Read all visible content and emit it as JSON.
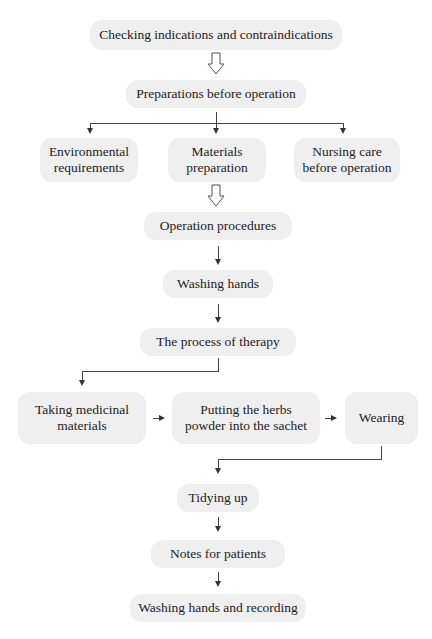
{
  "flowchart": {
    "nodes": {
      "checking": "Checking indications and contraindications",
      "preparations": "Preparations before operation",
      "environmental": [
        "Environmental",
        "requirements"
      ],
      "materials": [
        "Materials",
        "preparation"
      ],
      "nursing": [
        "Nursing care",
        "before operation"
      ],
      "operation": "Operation procedures",
      "washing": "Washing hands",
      "process": "The process of therapy",
      "taking": [
        "Taking medicinal",
        "materials"
      ],
      "putting": [
        "Putting the herbs",
        "powder into the sachet"
      ],
      "wearing": "Wearing",
      "tidying": "Tidying up",
      "notes": "Notes for patients",
      "final": "Washing hands and recording"
    },
    "colors": {
      "box_fill": "#efefef",
      "arrow": "#333333",
      "text": "#222222"
    }
  }
}
